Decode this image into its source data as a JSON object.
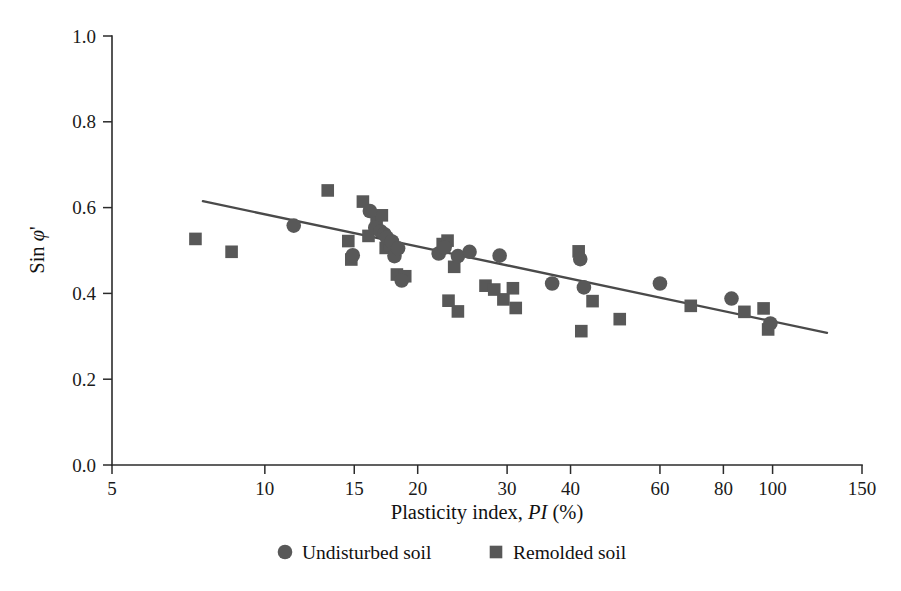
{
  "chart_data": {
    "type": "scatter",
    "title": "",
    "xlabel": "Plasticity index, PI (%)",
    "xlabel_parts": {
      "pre": "Plasticity index, ",
      "italic": "PI",
      "post": " (%)"
    },
    "ylabel": "Sin φ'",
    "ylabel_parts": {
      "pre": "Sin ",
      "italic": "φ",
      "post": "'"
    },
    "xscale": "log",
    "yscale": "linear",
    "xlim": [
      5,
      150
    ],
    "ylim": [
      0.0,
      1.0
    ],
    "grid": false,
    "x_ticks": [
      5,
      10,
      15,
      20,
      30,
      40,
      60,
      80,
      100,
      150
    ],
    "x_tick_labels": [
      "5",
      "10",
      "15",
      "20",
      "30",
      "40",
      "60",
      "80",
      "100",
      "150"
    ],
    "y_ticks": [
      0.0,
      0.2,
      0.4,
      0.6,
      0.8,
      1.0
    ],
    "y_tick_labels": [
      "0.0",
      "0.2",
      "0.4",
      "0.6",
      "0.8",
      "1.0"
    ],
    "legend_position": "below-axis",
    "colors": {
      "marker": "#585858",
      "trend_line": "#4a4a4a",
      "axis": "#2b2b2b",
      "text": "#111111",
      "background": "#ffffff"
    },
    "series": [
      {
        "name": "Undisturbed soil",
        "marker": "circle",
        "color": "#585858",
        "points": [
          [
            11.4,
            0.558
          ],
          [
            14.9,
            0.489
          ],
          [
            16.1,
            0.592
          ],
          [
            16.5,
            0.553
          ],
          [
            16.9,
            0.545
          ],
          [
            17.2,
            0.538
          ],
          [
            17.4,
            0.53
          ],
          [
            17.8,
            0.521
          ],
          [
            18.0,
            0.487
          ],
          [
            18.3,
            0.505
          ],
          [
            18.6,
            0.43
          ],
          [
            22.0,
            0.493
          ],
          [
            22.6,
            0.507
          ],
          [
            24.0,
            0.487
          ],
          [
            25.3,
            0.497
          ],
          [
            29.0,
            0.488
          ],
          [
            36.8,
            0.423
          ],
          [
            41.8,
            0.48
          ],
          [
            42.5,
            0.414
          ],
          [
            60.0,
            0.423
          ],
          [
            83.0,
            0.388
          ],
          [
            99.0,
            0.33
          ]
        ]
      },
      {
        "name": "Remolded soil",
        "marker": "square",
        "color": "#585858",
        "points": [
          [
            7.3,
            0.527
          ],
          [
            8.6,
            0.497
          ],
          [
            13.3,
            0.64
          ],
          [
            14.6,
            0.522
          ],
          [
            14.8,
            0.479
          ],
          [
            15.6,
            0.614
          ],
          [
            16.0,
            0.534
          ],
          [
            16.6,
            0.568
          ],
          [
            17.0,
            0.582
          ],
          [
            17.3,
            0.506
          ],
          [
            17.6,
            0.512
          ],
          [
            18.2,
            0.444
          ],
          [
            18.9,
            0.44
          ],
          [
            22.4,
            0.515
          ],
          [
            22.9,
            0.523
          ],
          [
            23.0,
            0.383
          ],
          [
            23.6,
            0.462
          ],
          [
            24.0,
            0.358
          ],
          [
            27.2,
            0.418
          ],
          [
            28.3,
            0.409
          ],
          [
            29.5,
            0.386
          ],
          [
            30.8,
            0.412
          ],
          [
            31.2,
            0.366
          ],
          [
            41.5,
            0.498
          ],
          [
            42.0,
            0.312
          ],
          [
            44.2,
            0.382
          ],
          [
            50.0,
            0.34
          ],
          [
            69.0,
            0.371
          ],
          [
            88.0,
            0.357
          ],
          [
            96.0,
            0.365
          ],
          [
            98.0,
            0.316
          ]
        ]
      }
    ],
    "trend_line": {
      "label": "",
      "x_start": 7.55,
      "y_start": 0.615,
      "x_end": 128.0,
      "y_end": 0.308
    }
  },
  "legend": {
    "items": [
      {
        "label": "Undisturbed soil",
        "marker": "circle-marker-icon"
      },
      {
        "label": "Remolded soil",
        "marker": "square-marker-icon"
      }
    ]
  }
}
